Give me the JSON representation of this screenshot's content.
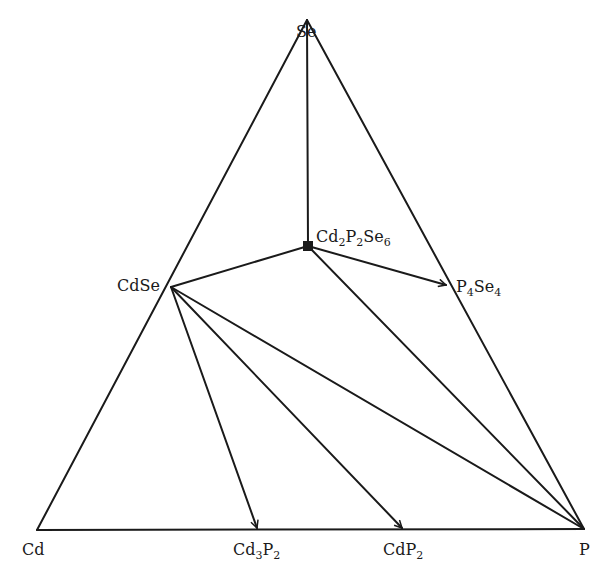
{
  "diagram": {
    "type": "ternary-phase-diagram",
    "vertices": {
      "top": {
        "label": "Se",
        "x": 307,
        "y": 20
      },
      "left": {
        "label": "Cd",
        "x": 37,
        "y": 530
      },
      "right": {
        "label": "P",
        "x": 584,
        "y": 529
      }
    },
    "compounds": [
      {
        "id": "CdSe",
        "base": "CdSe",
        "x": 171,
        "y": 287
      },
      {
        "id": "Cd2P2Se6",
        "x": 308,
        "y": 246
      },
      {
        "id": "P4Se4",
        "x": 446,
        "y": 285
      },
      {
        "id": "Cd3P2",
        "x": 257,
        "y": 528
      },
      {
        "id": "CdP2",
        "x": 402,
        "y": 528
      }
    ],
    "tie_lines": [
      {
        "from": "Se",
        "to": "Cd2P2Se6",
        "arrow": false
      },
      {
        "from": "CdSe",
        "to": "Cd2P2Se6",
        "arrow": false
      },
      {
        "from": "Cd2P2Se6",
        "to": "P4Se4",
        "arrow": true
      },
      {
        "from": "Cd2P2Se6",
        "to": "P",
        "arrow": false
      },
      {
        "from": "CdSe",
        "to": "P",
        "arrow": false
      },
      {
        "from": "CdSe",
        "to": "Cd3P2",
        "arrow": true
      },
      {
        "from": "CdSe",
        "to": "CdP2",
        "arrow": true
      }
    ],
    "labels": {
      "se": "Se",
      "cd": "Cd",
      "p": "P",
      "cdse": "CdSe",
      "cd2p2se6": {
        "a": "Cd",
        "s1": "2",
        "b": "P",
        "s2": "2",
        "c": "Se",
        "s3": "6"
      },
      "p4se4": {
        "a": "P",
        "s1": "4",
        "b": "Se",
        "s2": "4"
      },
      "cd3p2": {
        "a": "Cd",
        "s1": "3",
        "b": "P",
        "s2": "2"
      },
      "cdp2": {
        "a": "CdP",
        "s1": "2"
      }
    },
    "colors": {
      "line": "#1a1a1a",
      "background": "#ffffff"
    }
  }
}
